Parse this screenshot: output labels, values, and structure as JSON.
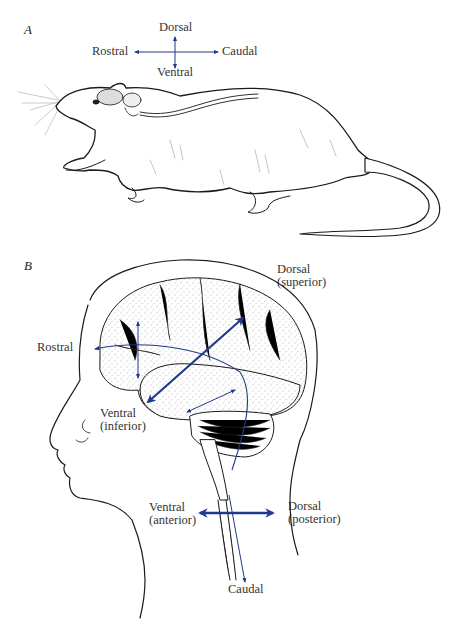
{
  "figure": {
    "panel_a": {
      "letter": "A",
      "subject": "rat",
      "axes": {
        "up": "Dorsal",
        "down": "Ventral",
        "left": "Rostral",
        "right": "Caudal"
      }
    },
    "panel_b": {
      "letter": "B",
      "subject": "human head with brain",
      "labels": {
        "dorsal_superior_1": "Dorsal",
        "dorsal_superior_2": "(superior)",
        "rostral": "Rostral",
        "ventral_inferior_1": "Ventral",
        "ventral_inferior_2": "(inferior)",
        "ventral_anterior_1": "Ventral",
        "ventral_anterior_2": "(anterior)",
        "dorsal_posterior_1": "Dorsal",
        "dorsal_posterior_2": "(posterior)",
        "caudal": "Caudal"
      }
    },
    "colors": {
      "arrow": "#1f3a8a",
      "ink": "#1a1a1a",
      "background": "#ffffff"
    }
  }
}
